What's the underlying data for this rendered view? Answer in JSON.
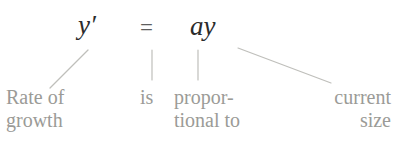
{
  "diagram": {
    "background_color": "#ffffff",
    "equation": {
      "lhs": "y′",
      "relation": "=",
      "rhs": "ay",
      "text_color": "#2b2b2b",
      "relation_color": "#5e5e5e"
    },
    "annotations": {
      "color": "#9b9b97",
      "growth": "Rate of\ngrowth",
      "is": "is",
      "proportional": "propor-\ntional to",
      "size": "current\nsize"
    },
    "connectors": {
      "color": "#bfbfbb",
      "lines": [
        {
          "name": "lhs-to-growth",
          "x1": 88,
          "y1": 50,
          "x2": 50,
          "y2": 88
        },
        {
          "name": "relation-to-is",
          "x1": 152,
          "y1": 50,
          "x2": 152,
          "y2": 80
        },
        {
          "name": "rhs-a-to-proportional",
          "x1": 198,
          "y1": 50,
          "x2": 198,
          "y2": 80
        },
        {
          "name": "rhs-y-to-size",
          "x1": 238,
          "y1": 48,
          "x2": 331,
          "y2": 83
        }
      ]
    }
  }
}
